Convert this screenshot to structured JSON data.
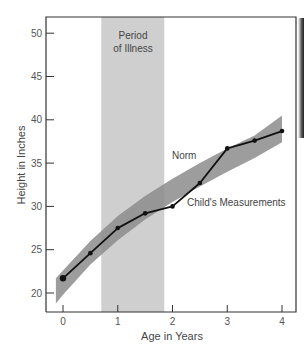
{
  "chart_data": {
    "type": "line",
    "title": "",
    "xlabel": "Age in Years",
    "ylabel": "Height in Inches",
    "xlim": [
      -0.25,
      4.3
    ],
    "ylim": [
      17.8,
      52
    ],
    "x_ticks": [
      0,
      1,
      2,
      3,
      4
    ],
    "y_ticks": [
      20,
      25,
      30,
      35,
      40,
      45,
      50
    ],
    "grid": false,
    "legend": "none (inline annotations)",
    "series": [
      {
        "name": "Child's Measurements",
        "type": "line-with-markers",
        "color": "#111111",
        "x": [
          0,
          0.5,
          1,
          1.5,
          2,
          2.5,
          3,
          3.5,
          4
        ],
        "y": [
          21.7,
          24.6,
          27.5,
          29.2,
          30.0,
          32.7,
          36.7,
          37.6,
          38.7
        ]
      },
      {
        "name": "Norm",
        "type": "band",
        "color": "#8c8c8c",
        "x": [
          -0.13,
          0,
          0.5,
          1,
          1.5,
          2,
          2.5,
          3,
          3.5,
          4
        ],
        "upper": [
          21.7,
          22.6,
          26.0,
          28.9,
          31.2,
          33.2,
          35.0,
          36.7,
          38.2,
          40.5
        ],
        "lower": [
          18.8,
          19.8,
          23.3,
          26.1,
          28.5,
          30.5,
          32.3,
          34.0,
          35.6,
          37.4
        ]
      }
    ],
    "shaded_regions": [
      {
        "label": "Period of Illness",
        "x_start": 0.7,
        "x_end": 1.85,
        "color": "#cfcfcf"
      }
    ],
    "annotations": [
      {
        "text": "Period",
        "x": 1.27,
        "y": 50.0
      },
      {
        "text": "of Illness",
        "x": 1.27,
        "y": 48.3
      },
      {
        "text": "Norm",
        "x": 2.75,
        "y": 35.6
      },
      {
        "text": "Child's Measurements",
        "x": 2.9,
        "y": 30.3
      }
    ]
  },
  "labels": {
    "xlabel": "Age in Years",
    "ylabel": "Height in Inches",
    "illness_line1": "Period",
    "illness_line2": "of Illness",
    "norm": "Norm",
    "child": "Child's Measurements"
  }
}
